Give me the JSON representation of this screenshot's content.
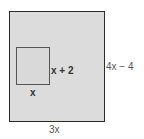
{
  "diagram": {
    "outer_rectangle": {
      "width_label": "3x",
      "height_label": "4x − 4",
      "fill": "#dcdcdc",
      "stroke": "#2a2a2a"
    },
    "inner_rectangle": {
      "width_label": "x",
      "height_label": "x + 2",
      "stroke": "#555555"
    }
  }
}
